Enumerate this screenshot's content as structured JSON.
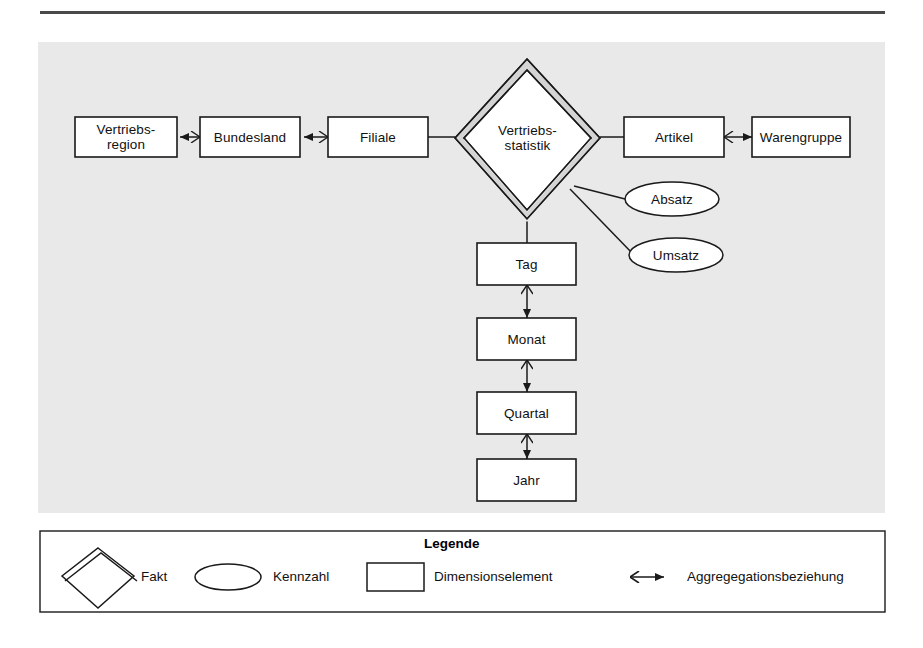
{
  "page": {
    "width": 923,
    "height": 648,
    "background": "#ffffff",
    "panel_fill": "#e9e9e9",
    "line_color": "#1a1a1a",
    "rule_color": "#4a4a4a"
  },
  "diagram": {
    "fact": {
      "label": "Vertriebs-\nstatistik",
      "label_line1": "Vertriebs-",
      "label_line2": "statistik",
      "shape": "double-diamond",
      "fill": "#ffffff",
      "band_fill": "#d4d4d4"
    },
    "dimension_elements": [
      {
        "id": "vertriebsregion",
        "label_line1": "Vertriebs-",
        "label_line2": "region",
        "label": "Vertriebs-region"
      },
      {
        "id": "bundesland",
        "label": "Bundesland"
      },
      {
        "id": "filiale",
        "label": "Filiale"
      },
      {
        "id": "artikel",
        "label": "Artikel"
      },
      {
        "id": "warengruppe",
        "label": "Warengruppe"
      },
      {
        "id": "tag",
        "label": "Tag"
      },
      {
        "id": "monat",
        "label": "Monat"
      },
      {
        "id": "quartal",
        "label": "Quartal"
      },
      {
        "id": "jahr",
        "label": "Jahr"
      }
    ],
    "measures": [
      {
        "id": "absatz",
        "label": "Absatz"
      },
      {
        "id": "umsatz",
        "label": "Umsatz"
      }
    ],
    "aggregations": [
      {
        "from": "bundesland",
        "to": "vertriebsregion"
      },
      {
        "from": "filiale",
        "to": "bundesland"
      },
      {
        "from": "artikel",
        "to": "warengruppe"
      },
      {
        "from": "tag",
        "to": "monat"
      },
      {
        "from": "monat",
        "to": "quartal"
      },
      {
        "from": "quartal",
        "to": "jahr"
      }
    ],
    "fact_connections": [
      {
        "from": "vertriebsstatistik",
        "to": "filiale"
      },
      {
        "from": "vertriebsstatistik",
        "to": "artikel"
      },
      {
        "from": "vertriebsstatistik",
        "to": "tag"
      },
      {
        "from": "vertriebsstatistik",
        "to": "absatz"
      },
      {
        "from": "vertriebsstatistik",
        "to": "umsatz"
      }
    ]
  },
  "legend": {
    "title": "Legende",
    "items": [
      {
        "id": "fakt",
        "symbol": "double-diamond",
        "label": "Fakt"
      },
      {
        "id": "kennzahl",
        "symbol": "ellipse",
        "label": "Kennzahl"
      },
      {
        "id": "dimensionselement",
        "symbol": "rectangle",
        "label": "Dimensionselement"
      },
      {
        "id": "aggregationsbeziehung",
        "symbol": "crowfoot-arrow",
        "label": "Aggregegationsbeziehung"
      }
    ]
  }
}
